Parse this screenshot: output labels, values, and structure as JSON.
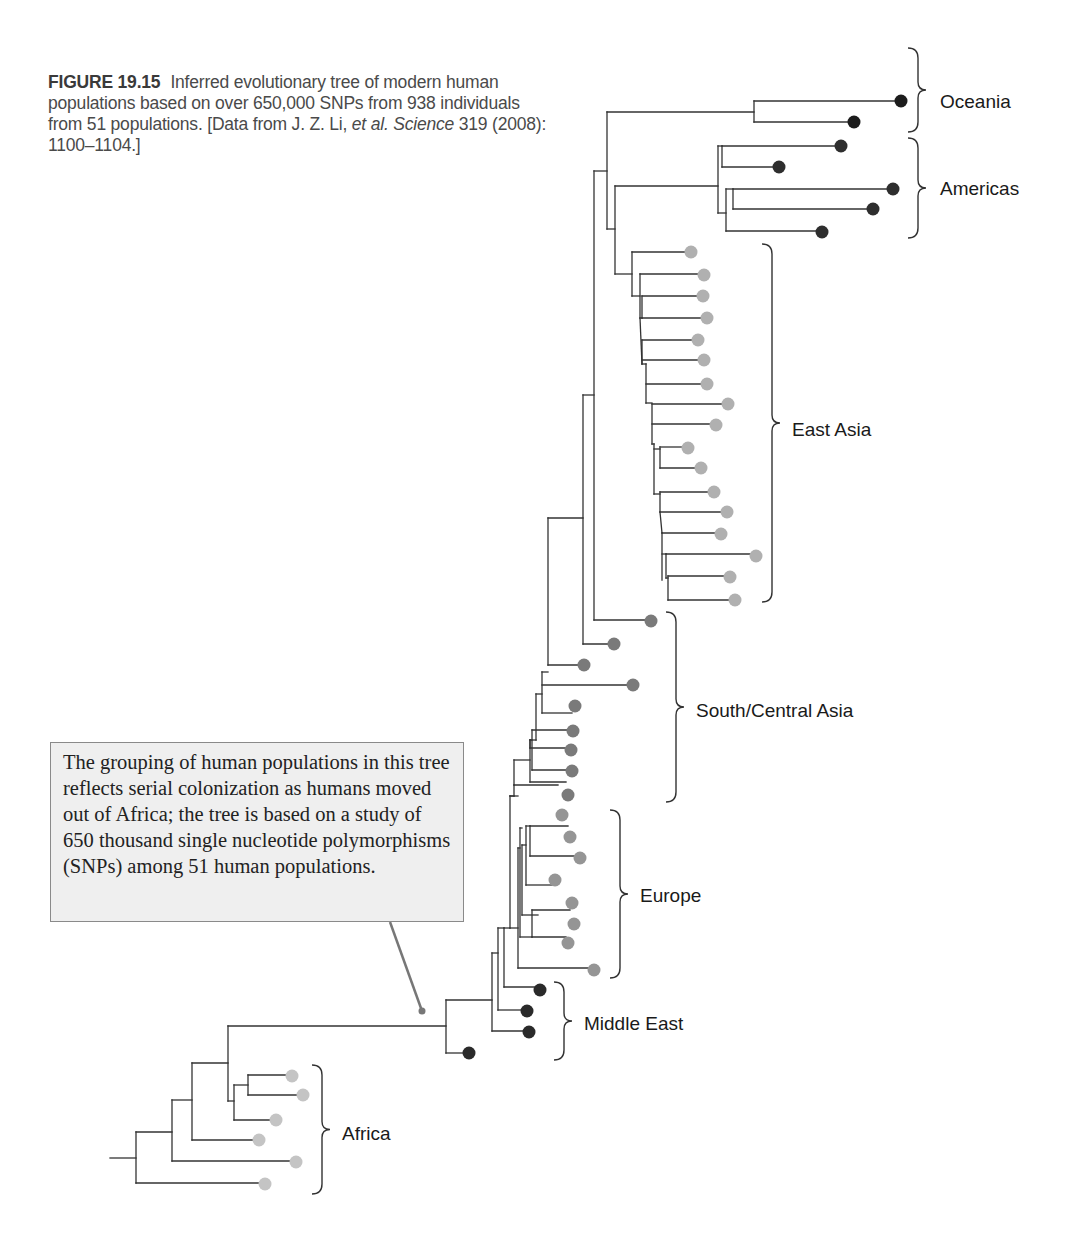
{
  "caption": {
    "figure_label": "FIGURE 19.15",
    "text_1": "Inferred evolutionary tree of modern human populations based on over 650,000 SNPs from 938 individuals from 51 populations. [Data from J. Z. Li,",
    "text_italic": "et al. Science",
    "text_2": "319 (2008): 1100–1104.]"
  },
  "callout": {
    "text": "The grouping of human populations in this tree reflects serial colonization as humans moved out of Africa; the tree is based on a study of 650 thousand single nucleotide polymorphisms (SNPs) among 51 human populations."
  },
  "regions": [
    {
      "name": "Oceania",
      "color": "#1c1c1c",
      "label_x": 940,
      "label_y": 108,
      "brace_x": 908,
      "brace_top": 48,
      "brace_bottom": 132
    },
    {
      "name": "Americas",
      "color": "#2e2e2e",
      "label_x": 940,
      "label_y": 195,
      "brace_x": 908,
      "brace_top": 138,
      "brace_bottom": 238
    },
    {
      "name": "East Asia",
      "color": "#b0b0b0",
      "label_x": 792,
      "label_y": 436,
      "brace_x": 762,
      "brace_top": 244,
      "brace_bottom": 602
    },
    {
      "name": "South/Central Asia",
      "color": "#7a7a7a",
      "label_x": 696,
      "label_y": 717,
      "brace_x": 666,
      "brace_top": 612,
      "brace_bottom": 802
    },
    {
      "name": "Europe",
      "color": "#959595",
      "label_x": 640,
      "label_y": 902,
      "brace_x": 610,
      "brace_top": 810,
      "brace_bottom": 978
    },
    {
      "name": "Middle East",
      "color": "#2a2a2a",
      "label_x": 584,
      "label_y": 1030,
      "brace_x": 554,
      "brace_top": 982,
      "brace_bottom": 1060
    },
    {
      "name": "Africa",
      "color": "#c4c4c4",
      "label_x": 342,
      "label_y": 1140,
      "brace_x": 312,
      "brace_top": 1065,
      "brace_bottom": 1194
    }
  ],
  "tree": {
    "line_color": "#333333",
    "segments": [
      [
        110,
        1158,
        136,
        1158
      ],
      [
        136,
        1132,
        136,
        1183
      ],
      [
        136,
        1132,
        172,
        1132
      ],
      [
        136,
        1183,
        262,
        1183
      ],
      [
        172,
        1100,
        172,
        1161
      ],
      [
        172,
        1100,
        192,
        1100
      ],
      [
        172,
        1161,
        294,
        1161
      ],
      [
        192,
        1063,
        192,
        1140
      ],
      [
        192,
        1063,
        228,
        1063
      ],
      [
        192,
        1140,
        258,
        1140
      ],
      [
        228,
        1026,
        228,
        1101
      ],
      [
        228,
        1026,
        446,
        1026
      ],
      [
        228,
        1101,
        234,
        1101
      ],
      [
        234,
        1085,
        234,
        1120
      ],
      [
        234,
        1085,
        248,
        1085
      ],
      [
        234,
        1120,
        274,
        1120
      ],
      [
        248,
        1075,
        248,
        1095
      ],
      [
        248,
        1075,
        288,
        1075
      ],
      [
        248,
        1095,
        302,
        1095
      ],
      [
        446,
        1000,
        446,
        1053
      ],
      [
        446,
        1053,
        466,
        1053
      ],
      [
        446,
        1000,
        492,
        1000
      ],
      [
        492,
        953,
        492,
        1031
      ],
      [
        492,
        1031,
        526,
        1031
      ],
      [
        492,
        953,
        498,
        953
      ],
      [
        498,
        928,
        498,
        1010
      ],
      [
        498,
        1010,
        526,
        1010
      ],
      [
        498,
        928,
        504,
        928
      ],
      [
        504,
        987,
        504,
        928
      ],
      [
        504,
        987,
        538,
        987
      ],
      [
        504,
        928,
        510,
        928
      ],
      [
        510,
        796,
        510,
        928
      ],
      [
        510,
        796,
        518,
        796
      ],
      [
        510,
        928,
        518,
        928
      ],
      [
        518,
        848,
        518,
        968
      ],
      [
        518,
        968,
        592,
        968
      ],
      [
        518,
        848,
        520,
        848
      ],
      [
        520,
        828,
        520,
        937
      ],
      [
        520,
        828,
        522,
        828
      ],
      [
        520,
        937,
        532,
        937
      ],
      [
        532,
        910,
        532,
        937
      ],
      [
        532,
        910,
        570,
        910
      ],
      [
        532,
        937,
        566,
        937
      ],
      [
        522,
        845,
        522,
        915
      ],
      [
        522,
        915,
        538,
        915
      ],
      [
        522,
        845,
        526,
        845
      ],
      [
        526,
        826,
        526,
        885
      ],
      [
        526,
        826,
        530,
        826
      ],
      [
        526,
        885,
        552,
        885
      ],
      [
        530,
        856,
        530,
        826
      ],
      [
        530,
        856,
        578,
        856
      ],
      [
        530,
        826,
        568,
        826
      ],
      [
        510,
        796,
        514,
        796
      ],
      [
        514,
        785,
        514,
        796
      ],
      [
        514,
        785,
        558,
        785
      ],
      [
        514,
        760,
        514,
        785
      ],
      [
        514,
        760,
        530,
        760
      ],
      [
        530,
        740,
        530,
        782
      ],
      [
        530,
        740,
        532,
        740
      ],
      [
        530,
        782,
        566,
        782
      ],
      [
        532,
        730,
        532,
        770
      ],
      [
        532,
        770,
        566,
        770
      ],
      [
        532,
        730,
        568,
        730
      ],
      [
        530,
        740,
        530,
        748
      ],
      [
        530,
        748,
        568,
        748
      ],
      [
        536,
        694,
        536,
        740
      ],
      [
        536,
        694,
        542,
        694
      ],
      [
        536,
        740,
        530,
        740
      ],
      [
        542,
        672,
        542,
        713
      ],
      [
        542,
        672,
        548,
        672
      ],
      [
        542,
        713,
        572,
        713
      ],
      [
        542,
        685,
        630,
        685
      ],
      [
        548,
        518,
        548,
        665
      ],
      [
        548,
        518,
        583,
        518
      ],
      [
        548,
        665,
        584,
        665
      ],
      [
        583,
        395,
        583,
        644
      ],
      [
        583,
        395,
        594,
        395
      ],
      [
        583,
        644,
        614,
        644
      ],
      [
        594,
        171,
        594,
        620
      ],
      [
        594,
        171,
        607,
        171
      ],
      [
        594,
        620,
        651,
        620
      ],
      [
        607,
        112,
        607,
        229
      ],
      [
        607,
        112,
        754,
        112
      ],
      [
        607,
        229,
        615,
        229
      ],
      [
        754,
        101,
        754,
        122
      ],
      [
        754,
        101,
        901,
        101
      ],
      [
        754,
        122,
        852,
        122
      ],
      [
        615,
        186,
        615,
        274
      ],
      [
        615,
        186,
        718,
        186
      ],
      [
        615,
        274,
        632,
        274
      ],
      [
        718,
        146,
        718,
        213
      ],
      [
        718,
        146,
        722,
        146
      ],
      [
        718,
        213,
        726,
        213
      ],
      [
        722,
        146,
        722,
        167
      ],
      [
        722,
        146,
        840,
        146
      ],
      [
        722,
        167,
        778,
        167
      ],
      [
        726,
        189,
        726,
        231
      ],
      [
        726,
        189,
        733,
        189
      ],
      [
        726,
        231,
        821,
        231
      ],
      [
        733,
        189,
        733,
        209
      ],
      [
        733,
        189,
        893,
        189
      ],
      [
        733,
        209,
        873,
        209
      ],
      [
        632,
        252,
        632,
        296
      ],
      [
        632,
        252,
        691,
        252
      ],
      [
        632,
        296,
        640,
        296
      ],
      [
        640,
        274,
        640,
        318
      ],
      [
        640,
        274,
        704,
        274
      ],
      [
        640,
        318,
        642,
        318
      ],
      [
        642,
        296,
        642,
        318
      ],
      [
        642,
        296,
        704,
        296
      ],
      [
        642,
        318,
        706,
        318
      ],
      [
        640,
        318,
        642,
        364
      ],
      [
        642,
        340,
        642,
        364
      ],
      [
        642,
        340,
        698,
        340
      ],
      [
        642,
        360,
        703,
        360
      ],
      [
        642,
        364,
        646,
        364
      ],
      [
        646,
        364,
        646,
        403
      ],
      [
        646,
        384,
        706,
        384
      ],
      [
        646,
        403,
        652,
        403
      ],
      [
        652,
        404,
        652,
        444
      ],
      [
        652,
        404,
        728,
        404
      ],
      [
        652,
        424,
        715,
        424
      ],
      [
        652,
        444,
        654,
        444
      ],
      [
        654,
        444,
        654,
        494
      ],
      [
        654,
        449,
        660,
        449
      ],
      [
        660,
        447,
        660,
        468
      ],
      [
        660,
        447,
        688,
        447
      ],
      [
        660,
        468,
        700,
        468
      ],
      [
        654,
        494,
        660,
        494
      ],
      [
        660,
        492,
        660,
        512
      ],
      [
        660,
        492,
        713,
        492
      ],
      [
        660,
        512,
        727,
        512
      ],
      [
        660,
        512,
        662,
        533
      ],
      [
        662,
        533,
        720,
        533
      ],
      [
        662,
        533,
        662,
        580
      ],
      [
        662,
        554,
        666,
        554
      ],
      [
        666,
        554,
        666,
        578
      ],
      [
        666,
        554,
        755,
        554
      ],
      [
        666,
        578,
        668,
        578
      ],
      [
        668,
        576,
        668,
        600
      ],
      [
        668,
        576,
        729,
        576
      ],
      [
        668,
        600,
        734,
        600
      ]
    ],
    "callout_pointer": {
      "x1": 390,
      "y1": 922,
      "x2": 422,
      "y2": 1011,
      "color": "#777777"
    }
  },
  "leaves": [
    {
      "x": 901,
      "y": 101,
      "region": "Oceania"
    },
    {
      "x": 854,
      "y": 122,
      "region": "Oceania"
    },
    {
      "x": 841,
      "y": 146,
      "region": "Americas"
    },
    {
      "x": 779,
      "y": 167,
      "region": "Americas"
    },
    {
      "x": 893,
      "y": 189,
      "region": "Americas"
    },
    {
      "x": 873,
      "y": 209,
      "region": "Americas"
    },
    {
      "x": 822,
      "y": 232,
      "region": "Americas"
    },
    {
      "x": 691,
      "y": 252,
      "region": "East Asia"
    },
    {
      "x": 704,
      "y": 275,
      "region": "East Asia"
    },
    {
      "x": 703,
      "y": 296,
      "region": "East Asia"
    },
    {
      "x": 707,
      "y": 318,
      "region": "East Asia"
    },
    {
      "x": 698,
      "y": 340,
      "region": "East Asia"
    },
    {
      "x": 704,
      "y": 360,
      "region": "East Asia"
    },
    {
      "x": 707,
      "y": 384,
      "region": "East Asia"
    },
    {
      "x": 728,
      "y": 404,
      "region": "East Asia"
    },
    {
      "x": 716,
      "y": 425,
      "region": "East Asia"
    },
    {
      "x": 688,
      "y": 448,
      "region": "East Asia"
    },
    {
      "x": 701,
      "y": 468,
      "region": "East Asia"
    },
    {
      "x": 714,
      "y": 492,
      "region": "East Asia"
    },
    {
      "x": 727,
      "y": 512,
      "region": "East Asia"
    },
    {
      "x": 721,
      "y": 534,
      "region": "East Asia"
    },
    {
      "x": 756,
      "y": 556,
      "region": "East Asia"
    },
    {
      "x": 730,
      "y": 577,
      "region": "East Asia"
    },
    {
      "x": 735,
      "y": 600,
      "region": "East Asia"
    },
    {
      "x": 651,
      "y": 621,
      "region": "South/Central Asia"
    },
    {
      "x": 614,
      "y": 644,
      "region": "South/Central Asia"
    },
    {
      "x": 584,
      "y": 665,
      "region": "South/Central Asia"
    },
    {
      "x": 633,
      "y": 685,
      "region": "South/Central Asia"
    },
    {
      "x": 575,
      "y": 706,
      "region": "South/Central Asia"
    },
    {
      "x": 573,
      "y": 731,
      "region": "South/Central Asia"
    },
    {
      "x": 571,
      "y": 750,
      "region": "South/Central Asia"
    },
    {
      "x": 572,
      "y": 771,
      "region": "South/Central Asia"
    },
    {
      "x": 568,
      "y": 795,
      "region": "South/Central Asia"
    },
    {
      "x": 562,
      "y": 815,
      "region": "Europe"
    },
    {
      "x": 570,
      "y": 837,
      "region": "Europe"
    },
    {
      "x": 580,
      "y": 858,
      "region": "Europe"
    },
    {
      "x": 555,
      "y": 880,
      "region": "Europe"
    },
    {
      "x": 572,
      "y": 903,
      "region": "Europe"
    },
    {
      "x": 574,
      "y": 924,
      "region": "Europe"
    },
    {
      "x": 568,
      "y": 943,
      "region": "Europe"
    },
    {
      "x": 594,
      "y": 970,
      "region": "Europe"
    },
    {
      "x": 540,
      "y": 990,
      "region": "Middle East"
    },
    {
      "x": 527,
      "y": 1011,
      "region": "Middle East"
    },
    {
      "x": 529,
      "y": 1032,
      "region": "Middle East"
    },
    {
      "x": 469,
      "y": 1053,
      "region": "Middle East"
    },
    {
      "x": 292,
      "y": 1076,
      "region": "Africa"
    },
    {
      "x": 303,
      "y": 1095,
      "region": "Africa"
    },
    {
      "x": 276,
      "y": 1120,
      "region": "Africa"
    },
    {
      "x": 259,
      "y": 1140,
      "region": "Africa"
    },
    {
      "x": 296,
      "y": 1162,
      "region": "Africa"
    },
    {
      "x": 265,
      "y": 1184,
      "region": "Africa"
    }
  ]
}
